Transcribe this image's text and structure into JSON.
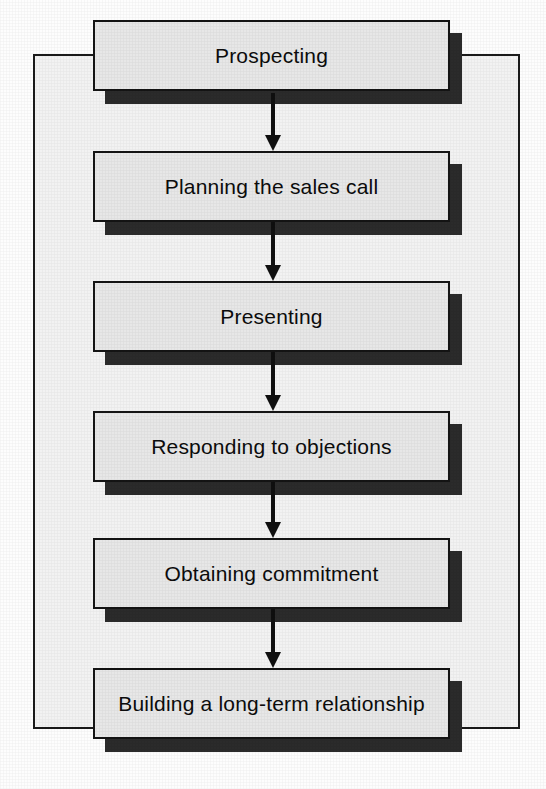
{
  "diagram": {
    "title": "",
    "type": "vertical-flowchart",
    "colors": {
      "page_background": "#fdfdfd",
      "frame_background": "#f2f2f2",
      "frame_border": "#1a1a1a",
      "box_fill": "#e7e7e7",
      "box_border": "#141414",
      "box_shadow": "#2b2b2b",
      "arrow": "#0f0f0f",
      "text": "#0c0c0c"
    },
    "steps": [
      {
        "order": 1,
        "label": "Prospecting"
      },
      {
        "order": 2,
        "label": "Planning the sales call"
      },
      {
        "order": 3,
        "label": "Presenting"
      },
      {
        "order": 4,
        "label": "Responding to objections"
      },
      {
        "order": 5,
        "label": "Obtaining commitment"
      },
      {
        "order": 6,
        "label": "Building a long-term relationship"
      }
    ],
    "connectors": [
      {
        "from": "Prospecting",
        "to": "Planning the sales call",
        "icon": "down-arrow-icon"
      },
      {
        "from": "Planning the sales call",
        "to": "Presenting",
        "icon": "down-arrow-icon"
      },
      {
        "from": "Presenting",
        "to": "Responding to objections",
        "icon": "down-arrow-icon"
      },
      {
        "from": "Responding to objections",
        "to": "Obtaining commitment",
        "icon": "down-arrow-icon"
      },
      {
        "from": "Obtaining commitment",
        "to": "Building a long-term relationship",
        "icon": "down-arrow-icon"
      }
    ]
  }
}
